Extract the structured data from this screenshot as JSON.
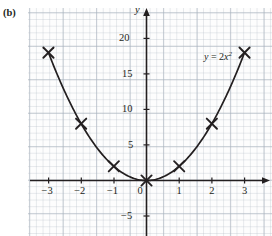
{
  "figure": {
    "panel_label": "(b)",
    "curve_label_prefix": "y",
    "curve_label_eq": " = 2",
    "curve_label_var": "x",
    "curve_label_exp": "2"
  },
  "chart_data": {
    "type": "line",
    "title": "",
    "subtitle": "",
    "xlabel": "",
    "ylabel": "y",
    "equation": "y = 2x^2",
    "annotations": [
      "(b)",
      "y = 2x²"
    ],
    "grid": true,
    "legend_position": "none",
    "xlim": [
      -3.55,
      3.6
    ],
    "ylim": [
      -7.5,
      22.5
    ],
    "xticks": [
      -3,
      -2,
      -1,
      0,
      1,
      2,
      3
    ],
    "xtick_labels": [
      "−3",
      "−2",
      "−1",
      "0",
      "1",
      "2",
      "3"
    ],
    "yticks": [
      -5,
      5,
      10,
      15,
      20
    ],
    "ytick_labels": [
      "−5",
      "5",
      "10",
      "15",
      "20"
    ],
    "origin_label": "0",
    "marker_style": "x",
    "series": [
      {
        "name": "y = 2x²",
        "x": [
          -3,
          -2,
          -1,
          0,
          1,
          2,
          3
        ],
        "values": [
          18,
          8,
          2,
          0,
          2,
          8,
          18
        ]
      }
    ]
  }
}
